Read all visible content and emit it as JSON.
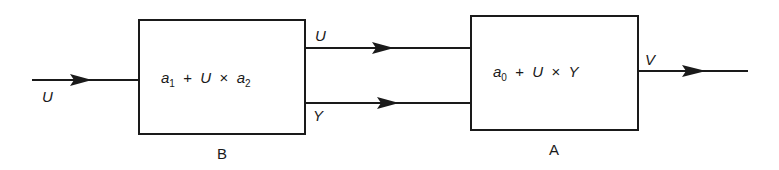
{
  "diagram": {
    "type": "block-diagram",
    "blocks": [
      {
        "id": "B",
        "caption": "B",
        "formula": {
          "t1": "a",
          "s1": "1",
          "op1": "+",
          "t2": "U",
          "op2": "×",
          "t3": "a",
          "s3": "2"
        }
      },
      {
        "id": "A",
        "caption": "A",
        "formula": {
          "t1": "a",
          "s1": "0",
          "op1": "+",
          "t2": "U",
          "op2": "×",
          "t3": "Y"
        }
      }
    ],
    "signals": {
      "input": "U",
      "b_to_a_top": "U",
      "b_to_a_bottom": "Y",
      "output": "V"
    },
    "colors": {
      "line": "#1a1a1a",
      "background": "#ffffff"
    }
  }
}
